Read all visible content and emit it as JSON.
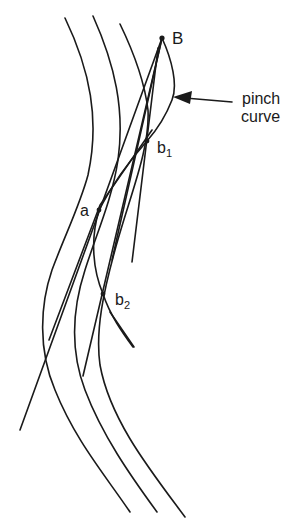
{
  "diagram": {
    "labels": {
      "B": "B",
      "a": "a",
      "b1_main": "b",
      "b1_sub": "1",
      "b2_main": "b",
      "b2_sub": "2",
      "pinch_line1": "pinch",
      "pinch_line2": "curve"
    },
    "colors": {
      "stroke": "#1a1a1a",
      "background": "#ffffff"
    }
  }
}
